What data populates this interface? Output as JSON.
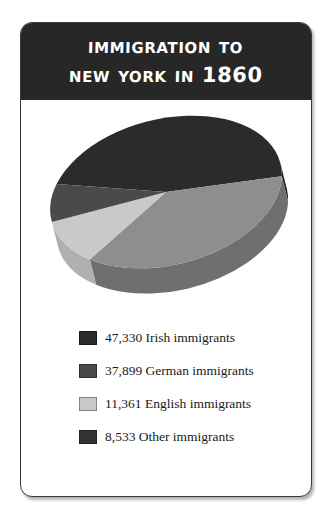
{
  "card": {
    "header": {
      "title_line_1": "Immigration To",
      "title_line_2": "New York In 1860",
      "background_color": "#272727",
      "text_color": "#ffffff"
    },
    "border_color": "#3a3a3a",
    "background_color": "#ffffff"
  },
  "legend": {
    "rows": [
      {
        "value": "47,330",
        "label": "47,330 Irish immigrants",
        "swatch_color": "#2b2b2b"
      },
      {
        "value": "37,899",
        "label": "37,899 German immigrants",
        "swatch_color": "#4a4a4a"
      },
      {
        "value": "11,361",
        "label": "11,361 English immigrants",
        "swatch_color": "#c9c9c9"
      },
      {
        "value": "8,533",
        "label": "8,533 Other immigrants",
        "swatch_color": "#333333"
      }
    ]
  },
  "chart_data": {
    "type": "pie",
    "title": "Immigration To New York In 1860",
    "subtitle": "",
    "xlabel": "",
    "ylabel": "",
    "three_d": true,
    "legend_position": "bottom",
    "grid": false,
    "total": 99123,
    "categories": [
      "Irish immigrants",
      "German immigrants",
      "English immigrants",
      "Other immigrants"
    ],
    "values": [
      47330,
      37899,
      11361,
      8533
    ],
    "percentages": [
      47.7,
      38.2,
      11.5,
      8.6
    ],
    "slices": [
      {
        "name": "Irish immigrants",
        "value": 47330,
        "percent": 47.7,
        "color": "#2b2b2b",
        "side_color": "#1d1d1d"
      },
      {
        "name": "German immigrants",
        "value": 37899,
        "percent": 38.2,
        "color": "#8e8e8e",
        "side_color": "#6f6f6f"
      },
      {
        "name": "English immigrants",
        "value": 11361,
        "percent": 11.5,
        "color": "#c9c9c9",
        "side_color": "#b0b0b0"
      },
      {
        "name": "Other immigrants",
        "value": 8533,
        "percent": 8.6,
        "color": "#4a4a4a",
        "side_color": "#3a3a3a"
      }
    ],
    "start_angle_deg": 208,
    "tilt": 0.62
  }
}
